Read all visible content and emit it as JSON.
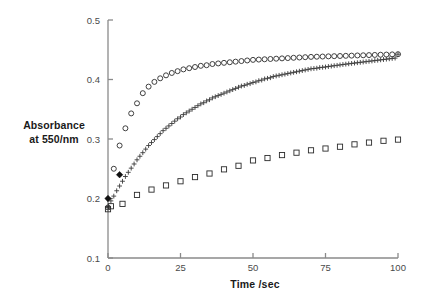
{
  "chart_data": {
    "type": "scatter",
    "title": "",
    "xlabel": "Time /sec",
    "ylabel_line1": "Absorbance",
    "ylabel_line2": "at 550/nm",
    "xlim": [
      0,
      100
    ],
    "ylim": [
      0.1,
      0.5
    ],
    "xticks": [
      0,
      25,
      50,
      75,
      100
    ],
    "xtick_labels": [
      "0",
      "25",
      "50",
      "75",
      "100"
    ],
    "yticks": [
      0.1,
      0.2,
      0.3,
      0.4,
      0.5
    ],
    "ytick_labels": [
      "0.1",
      "0.2",
      "0.3",
      "0.4",
      "0.5"
    ],
    "grid": false,
    "legend": "none",
    "series": [
      {
        "name": "open-circles",
        "marker": "circle-open",
        "color": "#2b2b2b",
        "x": [
          0,
          2,
          4,
          6,
          8,
          10,
          12,
          14,
          16,
          18,
          20,
          22,
          24,
          26,
          28,
          30,
          32,
          34,
          36,
          38,
          40,
          42,
          44,
          46,
          48,
          50,
          52,
          54,
          56,
          58,
          60,
          62,
          64,
          66,
          68,
          70,
          72,
          74,
          76,
          78,
          80,
          82,
          84,
          86,
          88,
          90,
          92,
          94,
          96,
          98,
          100
        ],
        "y": [
          0.185,
          0.25,
          0.289,
          0.318,
          0.343,
          0.36,
          0.377,
          0.388,
          0.396,
          0.402,
          0.407,
          0.411,
          0.414,
          0.417,
          0.419,
          0.421,
          0.423,
          0.424,
          0.426,
          0.427,
          0.428,
          0.429,
          0.43,
          0.431,
          0.432,
          0.433,
          0.4335,
          0.434,
          0.4345,
          0.435,
          0.4355,
          0.436,
          0.4365,
          0.437,
          0.4375,
          0.438,
          0.4383,
          0.4386,
          0.4389,
          0.4392,
          0.4395,
          0.4398,
          0.4401,
          0.4404,
          0.4407,
          0.441,
          0.4413,
          0.4416,
          0.4419,
          0.4422,
          0.4425
        ]
      },
      {
        "name": "plus-crosses",
        "marker": "plus",
        "color": "#3a3a3a",
        "x": [
          0,
          1,
          2,
          3,
          4,
          5,
          6,
          7,
          8,
          9,
          10,
          11,
          12,
          13,
          14,
          15,
          16,
          17,
          18,
          19,
          20,
          21,
          22,
          23,
          24,
          25,
          26,
          27,
          28,
          29,
          30,
          31,
          32,
          33,
          34,
          35,
          36,
          37,
          38,
          39,
          40,
          41,
          42,
          43,
          44,
          45,
          46,
          47,
          48,
          49,
          50,
          51,
          52,
          53,
          54,
          55,
          56,
          57,
          58,
          59,
          60,
          61,
          62,
          63,
          64,
          65,
          66,
          67,
          68,
          69,
          70,
          71,
          72,
          73,
          74,
          75,
          76,
          77,
          78,
          79,
          80,
          81,
          82,
          83,
          84,
          85,
          86,
          87,
          88,
          89,
          90,
          91,
          92,
          93,
          94,
          95,
          96,
          97,
          98,
          99,
          100
        ],
        "y": [
          0.185,
          0.196,
          0.204,
          0.213,
          0.221,
          0.229,
          0.237,
          0.244,
          0.251,
          0.258,
          0.265,
          0.271,
          0.277,
          0.283,
          0.289,
          0.294,
          0.299,
          0.304,
          0.309,
          0.314,
          0.318,
          0.322,
          0.326,
          0.33,
          0.334,
          0.337,
          0.341,
          0.344,
          0.347,
          0.35,
          0.353,
          0.356,
          0.359,
          0.361,
          0.364,
          0.366,
          0.369,
          0.371,
          0.373,
          0.375,
          0.377,
          0.379,
          0.381,
          0.383,
          0.385,
          0.387,
          0.389,
          0.39,
          0.392,
          0.393,
          0.395,
          0.396,
          0.398,
          0.399,
          0.401,
          0.402,
          0.403,
          0.405,
          0.406,
          0.407,
          0.408,
          0.409,
          0.41,
          0.411,
          0.412,
          0.413,
          0.414,
          0.415,
          0.416,
          0.417,
          0.418,
          0.4185,
          0.419,
          0.42,
          0.4205,
          0.421,
          0.4218,
          0.4225,
          0.4232,
          0.4238,
          0.4245,
          0.4252,
          0.4258,
          0.4264,
          0.427,
          0.4276,
          0.4282,
          0.4288,
          0.4294,
          0.43,
          0.4306,
          0.4312,
          0.4318,
          0.4324,
          0.433,
          0.4336,
          0.4342,
          0.4348,
          0.4354,
          0.436,
          0.4425
        ]
      },
      {
        "name": "open-squares",
        "marker": "square-open",
        "color": "#2b2b2b",
        "x": [
          0,
          1,
          5,
          10,
          15,
          20,
          25,
          30,
          35,
          40,
          45,
          50,
          55,
          60,
          65,
          70,
          75,
          80,
          85,
          90,
          95,
          100
        ],
        "y": [
          0.182,
          0.187,
          0.191,
          0.206,
          0.215,
          0.222,
          0.229,
          0.236,
          0.242,
          0.249,
          0.255,
          0.264,
          0.268,
          0.273,
          0.277,
          0.281,
          0.284,
          0.287,
          0.291,
          0.294,
          0.297,
          0.299
        ]
      },
      {
        "name": "filled-diamonds",
        "marker": "diamond-filled",
        "color": "#111111",
        "x": [
          0,
          4
        ],
        "y": [
          0.2,
          0.24
        ]
      }
    ]
  },
  "axis": {
    "ytitle_line1": "Absorbance",
    "ytitle_line2": "at 550/nm",
    "xtitle": "Time /sec"
  }
}
